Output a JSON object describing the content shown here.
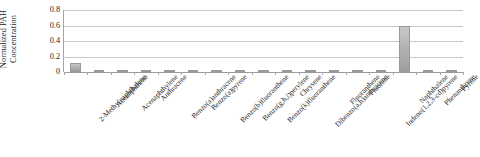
{
  "chart_data": {
    "type": "bar",
    "title": "",
    "subtitle": "",
    "xlabel": "",
    "ylabel": "Normalized PAH Concentration",
    "ylim": [
      0,
      0.8
    ],
    "yticks": [
      "0",
      "0.2",
      "0.4",
      "0.6",
      "0.8"
    ],
    "ytick_values": [
      0,
      0.2,
      0.4,
      0.6,
      0.8
    ],
    "grid": true,
    "legend": false,
    "legend_position": "none",
    "bar_color": "#b3b3b3",
    "categories": [
      "2-Methylnaphthalene",
      "Acenaphthene",
      "Acenaphthylene",
      "Anthracene",
      "Benzo(a)anthracene",
      "Benzo(a)pyrene",
      "Benzo(b)fluoranthene",
      "Benzo(g,h,i)perylene",
      "Benzo(k)fluoranthene",
      "Chrysene",
      "Dibenzo(a,h)anthracene",
      "Fluoranthene",
      "Fluorene",
      "Indeno(1,2,3-cd)pyrene",
      "Naphthalene",
      "Phenanthrene",
      "Pyrene"
    ],
    "values": [
      0.12,
      0.005,
      0.02,
      0.004,
      0.004,
      0.008,
      0.005,
      0.005,
      0.004,
      0.008,
      0.003,
      0.015,
      0.004,
      0.006,
      0.6,
      0.022,
      0.014
    ]
  },
  "axis": {
    "y_title": "Normalized PAH Concentration"
  }
}
